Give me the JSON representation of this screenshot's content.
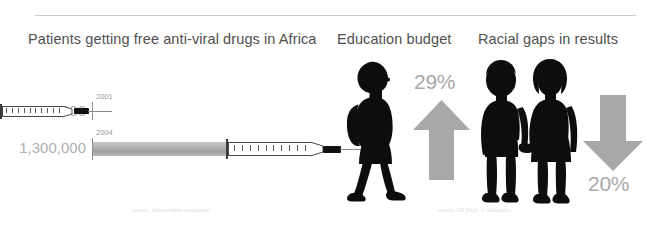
{
  "slide": {
    "background": "#ffffff",
    "divider_color": "#c9c9c9"
  },
  "panels": {
    "aids": {
      "title": "Patients getting free anti-viral drugs in Africa",
      "source": "source: Independent newspaper",
      "bars": [
        {
          "year": "2001",
          "value": "50,000",
          "raw": 50000
        },
        {
          "year": "2004",
          "value": "1,300,000",
          "raw": 1300000
        }
      ]
    },
    "education": {
      "title": "Education budget",
      "percent": "29%",
      "direction": "up",
      "source": "source: US Dept. of Education",
      "figure": "schoolchild-with-backpack-icon"
    },
    "racial": {
      "title": "Racial gaps in results",
      "percent": "20%",
      "direction": "down",
      "figure": "two-children-holding-hands-icon"
    }
  },
  "colors": {
    "title_text": "#4f4f4f",
    "value_text": "#b0b0b0",
    "year_text": "#9a9a9a",
    "arrow_gray": "#a8a8a8",
    "bar_gray": "#b4b4b4",
    "silhouette": "#0d0d0d",
    "caption_text": "#dedede"
  },
  "chart_data": {
    "type": "bar",
    "title": "Patients getting free anti-viral drugs in Africa",
    "categories": [
      "2001",
      "2004"
    ],
    "values": [
      50000,
      1300000
    ],
    "value_labels": [
      "50,000",
      "1,300,000"
    ],
    "xlabel": "",
    "ylabel": "",
    "orientation": "horizontal",
    "grid": false,
    "legend": false,
    "annotations": [
      {
        "label": "Education budget",
        "value": 29,
        "display": "29%",
        "direction": "up"
      },
      {
        "label": "Racial gaps in results",
        "value": 20,
        "display": "20%",
        "direction": "down"
      }
    ]
  }
}
